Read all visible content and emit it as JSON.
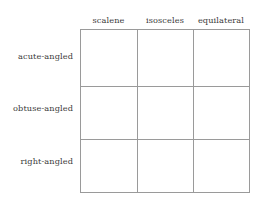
{
  "figure": {
    "kind": "classification-matrix",
    "columns": [
      "scalene",
      "isosceles",
      "equilateral"
    ],
    "rows": [
      "acute-angled",
      "obtuse-angled",
      "right-angled"
    ],
    "cells": [
      [
        "",
        "",
        ""
      ],
      [
        "",
        "",
        ""
      ],
      [
        "",
        "",
        ""
      ]
    ],
    "colors": {
      "background": "#ffffff",
      "border": "#9a9a9a",
      "text": "#3a3a3a"
    }
  }
}
